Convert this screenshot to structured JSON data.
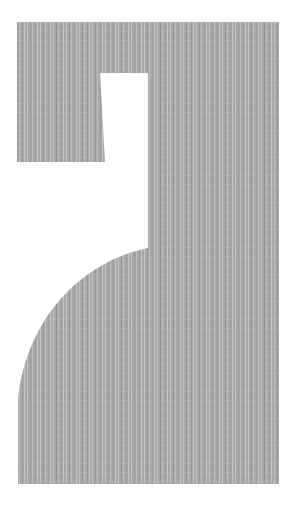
{
  "figure": {
    "colors": {
      "background": "#ffffff",
      "fill": "#a9a9a9",
      "stripe_light": "#c4c4c4",
      "stripe_dark": "#999999"
    }
  }
}
